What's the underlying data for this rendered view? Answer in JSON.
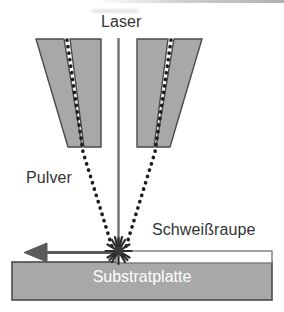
{
  "diagram": {
    "title_text_visible": false,
    "labels": {
      "laser": "Laser",
      "pulver": "Pulver",
      "schweissraupe": "Schweißraupe",
      "substratplatte": "Substratplatte"
    },
    "colors": {
      "nozzle_fill": "#a8a8a8",
      "nozzle_stroke": "#4a4a4a",
      "substrate_fill": "#a8a8a8",
      "substrate_stroke": "#4a4a4a",
      "bead_fill": "#ffffff",
      "bead_stroke": "#7a7a7a",
      "beam_color": "#6e6e6e",
      "powder_dot_color": "#1c1c1c",
      "arrow_color": "#5a5a5a",
      "label_text": "#343434",
      "substrate_text": "#ffffff",
      "background": "#ffffff"
    },
    "parts": {
      "laser_beam": "vertical laser beam line",
      "nozzle_left_outer": "left outer nozzle wall",
      "nozzle_left_inner": "left inner nozzle wall",
      "nozzle_right_inner": "right inner nozzle wall",
      "nozzle_right_outer": "right outer nozzle wall",
      "powder_stream_left": "left dotted powder stream",
      "powder_stream_right": "right dotted powder stream",
      "melt_pool": "melt pool starburst",
      "travel_arrow": "travel direction arrow pointing left",
      "weld_bead": "deposited weld bead strip",
      "substrate_plate": "substrate plate"
    },
    "icons": {
      "melt_pool": "starburst-icon",
      "travel_arrow": "arrow-left-icon"
    }
  }
}
